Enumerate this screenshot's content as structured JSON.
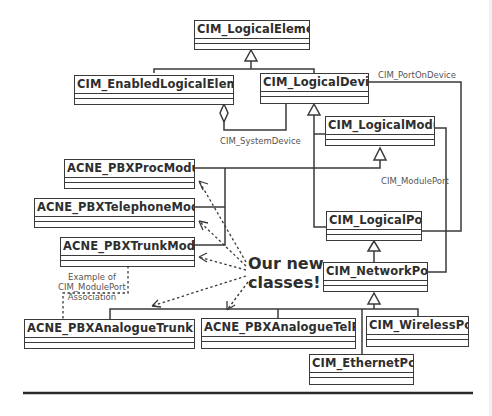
{
  "classes": {
    "logical_element": "CIM_LogicalElement",
    "enabled_logical_element": "CIM_EnabledLogicalElement",
    "logical_device": "CIM_LogicalDevice",
    "logical_module": "CIM_LogicalModule",
    "pbx_proc_module": "ACNE_PBXProcModule",
    "pbx_telephone_module": "ACNE_PBXTelephoneModule",
    "pbx_trunk_module": "ACNE_PBXTrunkModule",
    "logical_port": "CIM_LogicalPort",
    "network_port": "CIM_NetworkPort",
    "pbx_analogue_trunk_port": "ACNE_PBXAnalogueTrunkPort",
    "pbx_analogue_tel_port": "ACNE_PBXAnalogueTelPort",
    "wireless_port": "CIM_WirelessPort",
    "ethernet_port": "CIM_EthernetPort"
  },
  "associations": {
    "port_on_device": "CIM_PortOnDevice",
    "system_device": "CIM_SystemDevice",
    "module_port": "CIM_ModulePort"
  },
  "annotations": {
    "example_line1": "Example of",
    "example_line2": "CIM_ModulePort",
    "example_line3": "Association",
    "callout_line1": "Our new",
    "callout_line2": "classes!"
  },
  "colors": {
    "line": "#3a3a3a",
    "text": "#2e2e2e",
    "label": "#555555"
  }
}
